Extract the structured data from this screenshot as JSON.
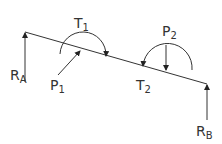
{
  "diagram": {
    "type": "beam free-body diagram",
    "beam": {
      "start": [
        25,
        32
      ],
      "end": [
        207,
        84
      ]
    },
    "labels": {
      "RA": {
        "main": "R",
        "sub": "A"
      },
      "RB": {
        "main": "R",
        "sub": "B"
      },
      "P1": {
        "main": "P",
        "sub": "1"
      },
      "P2": {
        "main": "P",
        "sub": "2"
      },
      "T1": {
        "main": "T",
        "sub": "1"
      },
      "T2": {
        "main": "T",
        "sub": "2"
      }
    },
    "colors": {
      "line": "#333333",
      "background": "#ffffff"
    }
  }
}
